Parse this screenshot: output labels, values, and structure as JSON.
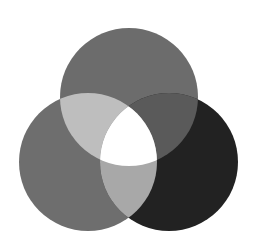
{
  "diagram": {
    "type": "three-circle-venn",
    "background": "#ffffff",
    "circles": [
      {
        "id": "top",
        "cx": 129,
        "cy": 97,
        "r": 69,
        "color": "#6c6c6c"
      },
      {
        "id": "bottom-left",
        "cx": 88,
        "cy": 162,
        "r": 69,
        "color": "#6e6e6e"
      },
      {
        "id": "bottom-right",
        "cx": 169,
        "cy": 162,
        "r": 69,
        "color": "#222222"
      }
    ],
    "overlaps": {
      "top_left": "#bebebe",
      "top_right": "#5a5a5a",
      "left_right": "#a8a8a8",
      "all_three": "#ffffff"
    }
  }
}
